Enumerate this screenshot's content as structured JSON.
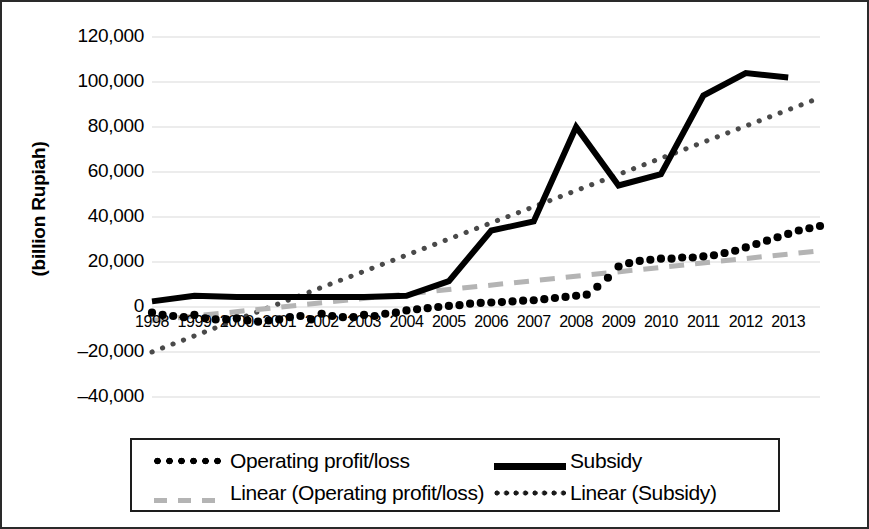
{
  "chart_data": {
    "type": "line",
    "title": "",
    "subtitle": "",
    "xlabel": "",
    "ylabel": "(billion Rupiah)",
    "ylim": [
      -40000,
      120000
    ],
    "ytick_labels": [
      "120,000",
      "100,000",
      "80,000",
      "60,000",
      "40,000",
      "20,000",
      "0",
      "–20,000",
      "–40,000"
    ],
    "ytick_values": [
      120000,
      100000,
      80000,
      60000,
      40000,
      20000,
      0,
      -20000,
      -40000
    ],
    "xtick_labels": [
      "1998",
      "1999",
      "2000",
      "2001",
      "2002",
      "2003",
      "2004",
      "2005",
      "2006",
      "2007",
      "2008",
      "2009",
      "2010",
      "2011",
      "2012",
      "2013"
    ],
    "x": [
      1998,
      1999,
      2000,
      2001,
      2002,
      2003,
      2004,
      2005,
      2006,
      2007,
      2008,
      2009,
      2010,
      2011,
      2012,
      2013
    ],
    "grid": true,
    "grid_color": "#d9d9d9",
    "legend_position": "bottom",
    "series": [
      {
        "name": "Operating profit/loss",
        "style": "dotted-markers",
        "color": "#000000",
        "x": [
          1998.0,
          1998.25,
          1998.5,
          1998.75,
          1999.0,
          1999.25,
          1999.5,
          1999.75,
          2000.0,
          2000.25,
          2000.5,
          2000.75,
          2001.0,
          2001.25,
          2001.5,
          2001.75,
          2002.0,
          2002.25,
          2002.5,
          2002.75,
          2003.0,
          2003.25,
          2003.5,
          2003.75,
          2004.0,
          2004.25,
          2004.5,
          2004.75,
          2005.0,
          2005.25,
          2005.5,
          2005.75,
          2006.0,
          2006.25,
          2006.5,
          2006.75,
          2007.0,
          2007.25,
          2007.5,
          2007.75,
          2008.0,
          2008.25,
          2008.5,
          2008.75,
          2009.0,
          2009.25,
          2009.5,
          2009.75,
          2010.0,
          2010.25,
          2010.5,
          2010.75,
          2011.0,
          2011.25,
          2011.5,
          2011.75,
          2012.0,
          2012.25,
          2012.5,
          2012.75,
          2013.0,
          2013.25,
          2013.5,
          2013.75
        ],
        "values": [
          -2500,
          -3500,
          -4000,
          -4500,
          -3500,
          -5000,
          -5500,
          -5500,
          -5000,
          -6000,
          -6500,
          -6000,
          -5500,
          -4500,
          -4000,
          -5500,
          -3000,
          -4000,
          -4500,
          -4500,
          -3500,
          -4000,
          -3000,
          -2500,
          -1500,
          -1000,
          -500,
          0,
          500,
          800,
          1500,
          1800,
          2000,
          2200,
          2500,
          2800,
          3000,
          3500,
          4000,
          4500,
          5000,
          5500,
          9000,
          13000,
          18000,
          19500,
          20500,
          21000,
          21500,
          21500,
          22000,
          22000,
          22500,
          23000,
          24000,
          25000,
          26500,
          28000,
          29500,
          31000,
          32500,
          34000,
          35000,
          36000
        ]
      },
      {
        "name": "Subsidy",
        "style": "solid-thick",
        "color": "#000000",
        "x": [
          1998,
          1999,
          2000,
          2001,
          2002,
          2003,
          2004,
          2005,
          2006,
          2007,
          2008,
          2009,
          2010,
          2011,
          2012,
          2013
        ],
        "values": [
          2500,
          5000,
          4500,
          4500,
          4500,
          4500,
          5000,
          11500,
          34000,
          38000,
          80000,
          54000,
          59000,
          94000,
          104000,
          102000
        ]
      },
      {
        "name": "Linear (Operating profit/loss)",
        "style": "dashed-gray",
        "color": "#b4b4b4",
        "x": [
          1998,
          2013.75
        ],
        "values": [
          -6000,
          25000
        ]
      },
      {
        "name": "Linear (Subsidy)",
        "style": "dotted-gray",
        "color": "#4a4a4a",
        "x": [
          1998,
          2013.75
        ],
        "values": [
          -20000,
          93000
        ]
      }
    ]
  },
  "legend": {
    "items": [
      {
        "label": "Operating profit/loss",
        "key": "dots-black"
      },
      {
        "label": "Subsidy",
        "key": "solid-black"
      },
      {
        "label": "Linear (Operating profit/loss)",
        "key": "dash-gray"
      },
      {
        "label": "Linear (Subsidy)",
        "key": "dots-small"
      }
    ]
  }
}
